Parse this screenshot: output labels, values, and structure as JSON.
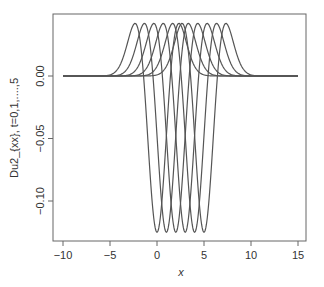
{
  "chart_data": {
    "type": "line",
    "title": "",
    "xlabel": "x",
    "ylabel": "Du2_{xx}, t=0,1,....,5",
    "xlim": [
      -10,
      15
    ],
    "ylim": [
      -0.13,
      0.045
    ],
    "x_ticks": [
      -10,
      -5,
      0,
      5,
      10,
      15
    ],
    "x_tick_labels": [
      "−10",
      "−5",
      "0",
      "5",
      "10",
      "15"
    ],
    "y_ticks": [
      0.0,
      -0.05,
      -0.1
    ],
    "y_tick_labels": [
      "0.00",
      "−0.05",
      "−0.10"
    ],
    "grid": false,
    "legend": null,
    "line_color": "#555555",
    "curve_model": {
      "description": "Second-derivative-of-Gaussian-like wave shifted by t",
      "trough_value": -0.125,
      "peak_value": 0.042,
      "zero_crossing_offset": 1.43,
      "peak_offset": 2.4
    },
    "series": [
      {
        "name": "t=0",
        "center": 0,
        "min": -0.125,
        "min_x": 0,
        "max": 0.042,
        "max_x": [
          -2.4,
          2.4
        ]
      },
      {
        "name": "t=1",
        "center": 1,
        "min": -0.125,
        "min_x": 1,
        "max": 0.042,
        "max_x": [
          -1.4,
          3.4
        ]
      },
      {
        "name": "t=2",
        "center": 2,
        "min": -0.125,
        "min_x": 2,
        "max": 0.042,
        "max_x": [
          -0.4,
          4.4
        ]
      },
      {
        "name": "t=3",
        "center": 3,
        "min": -0.125,
        "min_x": 3,
        "max": 0.042,
        "max_x": [
          0.6,
          5.4
        ]
      },
      {
        "name": "t=4",
        "center": 4,
        "min": -0.125,
        "min_x": 4,
        "max": 0.042,
        "max_x": [
          1.6,
          6.4
        ]
      },
      {
        "name": "t=5",
        "center": 5,
        "min": -0.125,
        "min_x": 5,
        "max": 0.042,
        "max_x": [
          2.6,
          7.4
        ]
      }
    ]
  },
  "labels": {
    "xlabel": "x",
    "ylabel": "Du2_{xx}, t=0,1,....,5"
  }
}
